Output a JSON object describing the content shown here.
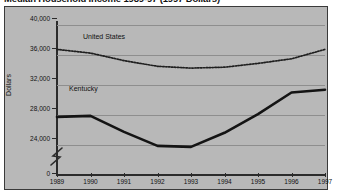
{
  "chart_data": {
    "type": "line",
    "title": "Median Household Income 1989-97 (1997 Dollars)",
    "xlabel": "",
    "ylabel": "Dollars",
    "categories": [
      "1989",
      "1990",
      "1991",
      "1992",
      "1993",
      "1994",
      "1995",
      "1996",
      "1997"
    ],
    "x": [
      1989,
      1990,
      1991,
      1992,
      1993,
      1994,
      1995,
      1996,
      1997
    ],
    "ylim": [
      24000,
      40000
    ],
    "yticks": [
      "0",
      "24,000",
      "28,000",
      "32,000",
      "36,000",
      "40,000"
    ],
    "ytick_values": [
      0,
      24000,
      28000,
      32000,
      36000,
      40000
    ],
    "axis_break": true,
    "grid": true,
    "legend": "inline-labels",
    "series": [
      {
        "name": "United States",
        "style": "dotted",
        "color": "#1f1f1f",
        "values": [
          37400,
          37000,
          36200,
          35600,
          35400,
          35500,
          35900,
          36400,
          37400
        ]
      },
      {
        "name": "Kentucky",
        "style": "solid",
        "color": "#1a1a1a",
        "values": [
          30200,
          30300,
          28600,
          27100,
          27000,
          28500,
          30500,
          32800,
          33100
        ]
      }
    ]
  },
  "figure": {
    "background": "#b8b8b8",
    "page_background": "#ffffff",
    "border_color": "#3a3a3a",
    "grid_color": "#8e8e8e"
  }
}
